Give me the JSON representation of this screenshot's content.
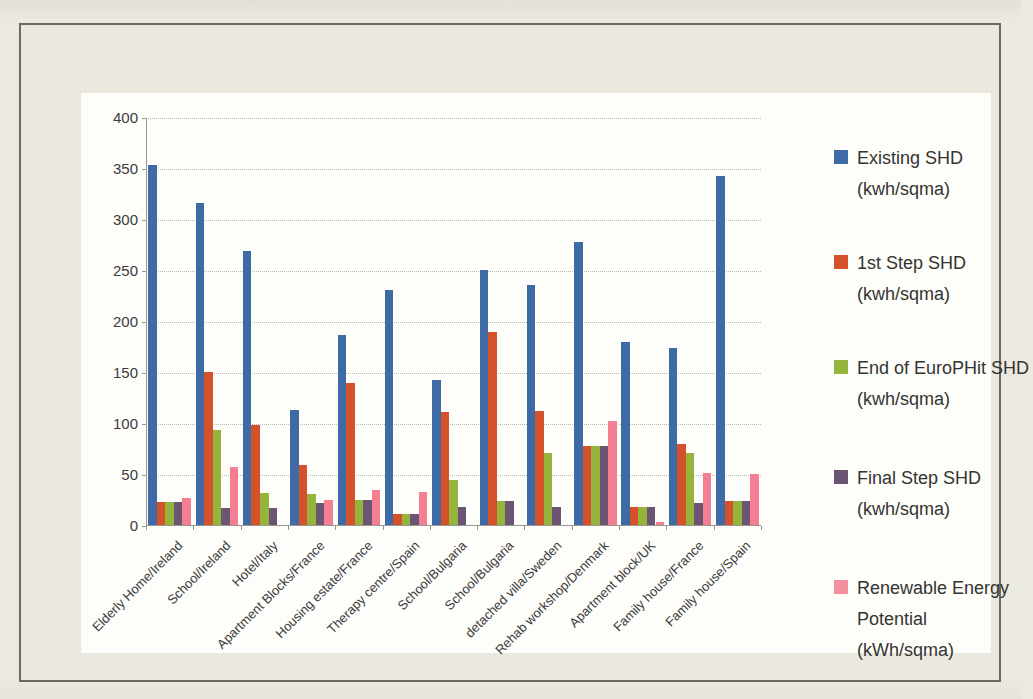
{
  "page": {
    "background_color": "#ece9e1",
    "frame_border_color": "#6a6964",
    "chart_background_color": "#fdfdfa"
  },
  "chart_data": {
    "type": "bar",
    "title": "",
    "xlabel": "",
    "ylabel": "",
    "grid": true,
    "legend_position": "right",
    "y_axis": {
      "min": 0,
      "max": 400,
      "step": 50,
      "tick_labels": [
        "0",
        "50",
        "100",
        "150",
        "200",
        "250",
        "300",
        "350",
        "400"
      ]
    },
    "categories": [
      "Elderly Home/Ireland",
      "School/Ireland",
      "Hotel/Italy",
      "Apartment Blocks/France",
      "Housing estate/France",
      "Therapy centre/Spain",
      "School/Bulgaria",
      "School/Bulgaria",
      "detached villa/Sweden",
      "Rehab workshop/Denmark",
      "Apartment block/UK",
      "Family house/France",
      "Family house/Spain"
    ],
    "series": [
      {
        "name": "Existing SHD (kwh/sqma)",
        "color": "#3e6aa6",
        "values": [
          353,
          316,
          269,
          113,
          186,
          230,
          142,
          250,
          235,
          277,
          179,
          174,
          342
        ]
      },
      {
        "name": "1st Step SHD (kwh/sqma)",
        "color": "#d5512c",
        "values": [
          23,
          150,
          98,
          59,
          139,
          11,
          111,
          189,
          112,
          77,
          18,
          79,
          24
        ]
      },
      {
        "name": "End of EuroPHit SHD (kwh/sqma)",
        "color": "#94b43c",
        "values": [
          23,
          93,
          31,
          30,
          25,
          11,
          44,
          24,
          71,
          77,
          18,
          71,
          24
        ]
      },
      {
        "name": "Final Step SHD (kwh/sqma)",
        "color": "#6c5573",
        "values": [
          23,
          17,
          17,
          22,
          25,
          11,
          18,
          24,
          18,
          77,
          18,
          22,
          24
        ]
      },
      {
        "name": "Renewable Energy Potential (kWh/sqma)",
        "color": "#f47e92",
        "values": [
          26,
          57,
          0,
          25,
          34,
          32,
          0,
          0,
          0,
          102,
          3,
          51,
          50
        ]
      }
    ],
    "legend": [
      {
        "lines": [
          "Existing SHD",
          "(kwh/sqma)"
        ],
        "color": "#3e6aa6"
      },
      {
        "lines": [
          "1st Step SHD",
          "(kwh/sqma)"
        ],
        "color": "#d5512c"
      },
      {
        "lines": [
          "End of EuroPHit SHD",
          "(kwh/sqma)"
        ],
        "color": "#94b43c"
      },
      {
        "lines": [
          "Final Step SHD",
          "(kwh/sqma)"
        ],
        "color": "#6c5573"
      },
      {
        "lines": [
          "Renewable Energy",
          "Potential",
          "(kWh/sqma)"
        ],
        "color": "#f58f9e"
      }
    ]
  }
}
